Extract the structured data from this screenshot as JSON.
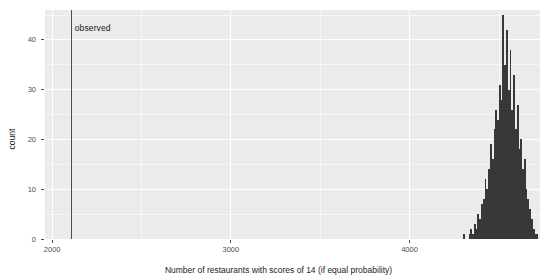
{
  "chart_data": {
    "type": "bar",
    "title": "",
    "subtitle": "",
    "xlabel": "Number of restaurants with scores of 14 (if equal probability)",
    "ylabel": "count",
    "xlim": [
      1960,
      4730
    ],
    "ylim": [
      0,
      46
    ],
    "xticks": [
      2000,
      3000,
      4000
    ],
    "xtick_labels": [
      "2000",
      "3000",
      "4000"
    ],
    "yticks": [
      0,
      10,
      20,
      30,
      40
    ],
    "ytick_labels": [
      "0",
      "10",
      "20",
      "30",
      "40"
    ],
    "grid": "white major and minor gridlines on gray panel",
    "legend": "none",
    "annotations": [
      {
        "name": "observed",
        "label": "observed",
        "type": "vline",
        "x": 2110
      }
    ],
    "bin_width": 10,
    "categories": [
      4305,
      4315,
      4325,
      4335,
      4345,
      4355,
      4365,
      4375,
      4385,
      4395,
      4405,
      4415,
      4425,
      4435,
      4445,
      4455,
      4465,
      4475,
      4485,
      4495,
      4505,
      4515,
      4525,
      4535,
      4545,
      4555,
      4565,
      4575,
      4585,
      4595,
      4605,
      4615,
      4625,
      4635,
      4645,
      4655,
      4665,
      4675,
      4685,
      4695,
      4705,
      4715
    ],
    "values": [
      1,
      0,
      0,
      1,
      2,
      1,
      3,
      2,
      5,
      4,
      7,
      8,
      12,
      10,
      14,
      19,
      16,
      22,
      26,
      24,
      31,
      28,
      45,
      35,
      42,
      30,
      38,
      26,
      33,
      22,
      27,
      18,
      20,
      14,
      16,
      10,
      8,
      6,
      4,
      2,
      1,
      1
    ]
  },
  "axes": {
    "y_label": "count",
    "x_label": "Number of restaurants with scores of 14 (if equal probability)"
  },
  "colors": {
    "panel_background": "#ebebeb",
    "grid": "#ffffff",
    "bar_fill": "#383838",
    "observed_line": "#4d4d4d",
    "axis_text": "#4d4d4d",
    "label_text": "#1a1a1a",
    "figure_background": "#ffffff"
  }
}
